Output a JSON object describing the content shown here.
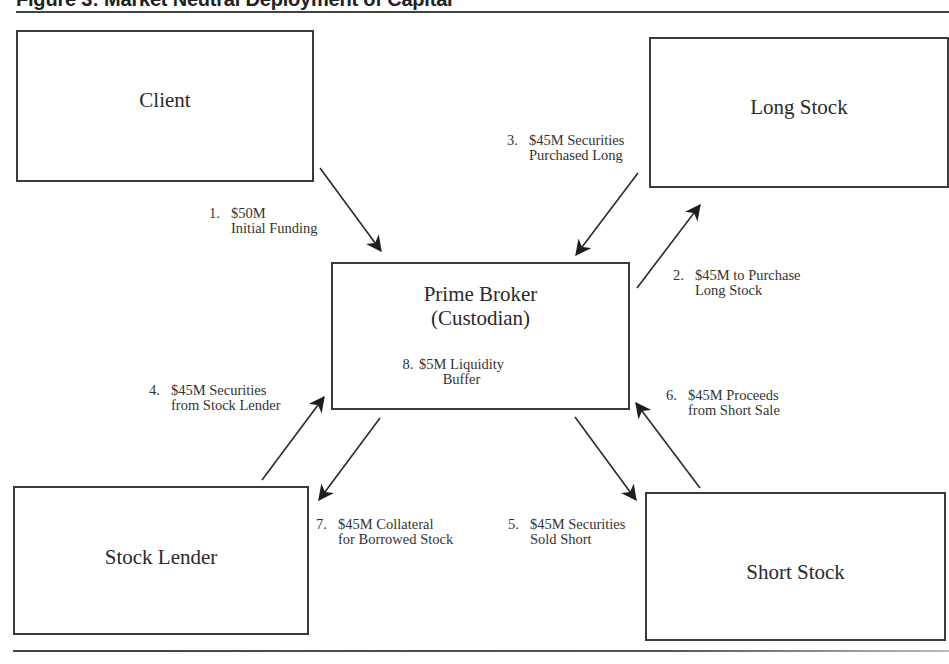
{
  "figure": {
    "title": "Figure 3: Market Neutral Deployment of Capital"
  },
  "nodes": {
    "client": {
      "label": "Client"
    },
    "long_stock": {
      "label": "Long Stock"
    },
    "prime_broker": {
      "label_line1": "Prime Broker",
      "label_line2": "(Custodian)"
    },
    "stock_lender": {
      "label": "Stock Lender"
    },
    "short_stock": {
      "label": "Short Stock"
    }
  },
  "flows": [
    {
      "num": "1.",
      "line1": "$50M",
      "line2": "Initial Funding",
      "from": "Client",
      "to": "Prime Broker"
    },
    {
      "num": "2.",
      "line1": "$45M to Purchase",
      "line2": "Long Stock",
      "from": "Prime Broker",
      "to": "Long Stock"
    },
    {
      "num": "3.",
      "line1": "$45M Securities",
      "line2": "Purchased Long",
      "from": "Long Stock",
      "to": "Prime Broker"
    },
    {
      "num": "4.",
      "line1": "$45M Securities",
      "line2": "from Stock Lender",
      "from": "Stock Lender",
      "to": "Prime Broker"
    },
    {
      "num": "5.",
      "line1": "$45M Securities",
      "line2": "Sold Short",
      "from": "Prime Broker",
      "to": "Short Stock"
    },
    {
      "num": "6.",
      "line1": "$45M Proceeds",
      "line2": "from Short Sale",
      "from": "Short Stock",
      "to": "Prime Broker"
    },
    {
      "num": "7.",
      "line1": "$45M Collateral",
      "line2": "for Borrowed Stock",
      "from": "Prime Broker",
      "to": "Stock Lender"
    },
    {
      "num": "8.",
      "line1": "$5M Liquidity",
      "line2": "Buffer",
      "from": "",
      "to": "Prime Broker"
    }
  ]
}
